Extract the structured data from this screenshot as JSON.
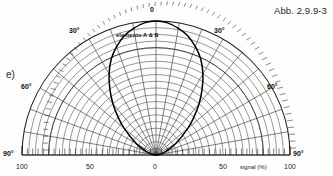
{
  "figure": {
    "caption": "Abb. 2.9.9-3",
    "panel_label": "e)"
  },
  "annotations": {
    "lobe_label": "elements A & B"
  },
  "axes": {
    "radial_axis_title": "signal (%)",
    "radial_tick_labels_left": [
      "100",
      "50"
    ],
    "radial_tick_labels_center": "0",
    "radial_tick_labels_right": [
      "50",
      "100"
    ],
    "angle_label_top": "0",
    "angle_labels_left": [
      "30°",
      "60°",
      "90°"
    ],
    "angle_labels_right": [
      "30°",
      "60°",
      "90°"
    ]
  },
  "colors": {
    "ink": "#1a1a1a",
    "grid": "#3a3a3a",
    "lobe": "#000000",
    "paper": "#fdfdfc"
  },
  "chart_data": {
    "type": "line",
    "title": "Abb. 2.9.9-3",
    "subtitle": "e)",
    "projection": "polar-semicircle",
    "xlabel": "signal (%)",
    "ylabel": "",
    "grid": true,
    "legend": "none",
    "theta_label": "angle (degrees from 0° axis)",
    "theta_range_deg": [
      -90,
      90
    ],
    "theta_major_step_deg": 10,
    "theta_minor_step_deg": 2.5,
    "r_label": "signal (%)",
    "rlim": [
      0,
      100
    ],
    "r_major_step": 5,
    "r_tick_labels": [
      "100",
      "50",
      "0",
      "50",
      "100"
    ],
    "angle_tick_labels": [
      "90°",
      "60°",
      "30°",
      "0",
      "30°",
      "60°",
      "90°"
    ],
    "series": [
      {
        "name": "elements A & B",
        "kind": "directivity-lobe",
        "note": "bold teardrop / cardioid-like response curve emerging from the origin",
        "theta_deg": [
          -90,
          -80,
          -70,
          -60,
          -50,
          -45,
          -40,
          -35,
          -30,
          -25,
          -20,
          -15,
          -10,
          -5,
          0,
          5,
          10,
          15,
          20,
          25,
          30,
          35,
          40,
          45,
          50,
          60,
          70,
          80,
          90
        ],
        "r_percent": [
          0,
          3,
          8,
          17,
          31,
          40,
          50,
          60,
          70,
          79,
          86,
          92,
          96,
          99,
          100,
          99,
          96,
          92,
          86,
          79,
          70,
          60,
          50,
          40,
          31,
          17,
          8,
          3,
          0
        ]
      }
    ]
  }
}
